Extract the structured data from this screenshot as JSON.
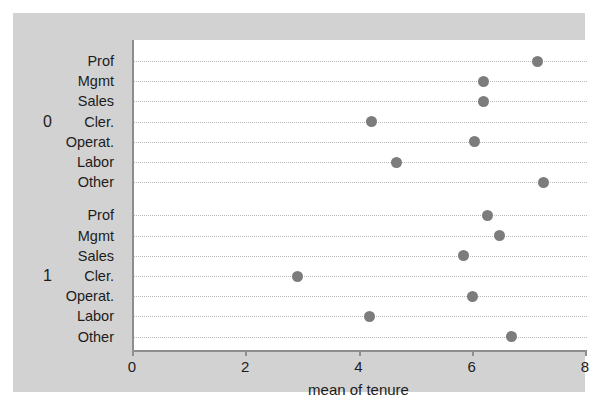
{
  "chart_data": {
    "type": "scatter",
    "title": "",
    "xlabel": "mean of tenure",
    "ylabel": "",
    "xlim": [
      0,
      8
    ],
    "xticks": [
      0,
      2,
      4,
      6,
      8
    ],
    "xtick_labels": [
      "0",
      "2",
      "4",
      "6",
      "8"
    ],
    "grid": true,
    "grid_style": "dotted horizontal",
    "legend": "none",
    "marker_color": "#7c7c7c",
    "panel_background": "#d2d2d2",
    "plot_background": "#ffffff",
    "groups": [
      {
        "label": "0",
        "categories": [
          "Prof",
          "Mgmt",
          "Sales",
          "Cler.",
          "Operat.",
          "Labor",
          "Other"
        ],
        "values": [
          7.12,
          6.17,
          6.17,
          4.19,
          6.01,
          4.63,
          7.23
        ]
      },
      {
        "label": "1",
        "categories": [
          "Prof",
          "Mgmt",
          "Sales",
          "Cler.",
          "Operat.",
          "Labor",
          "Other"
        ],
        "values": [
          6.25,
          6.45,
          5.82,
          2.89,
          5.97,
          4.16,
          6.67
        ]
      }
    ]
  }
}
